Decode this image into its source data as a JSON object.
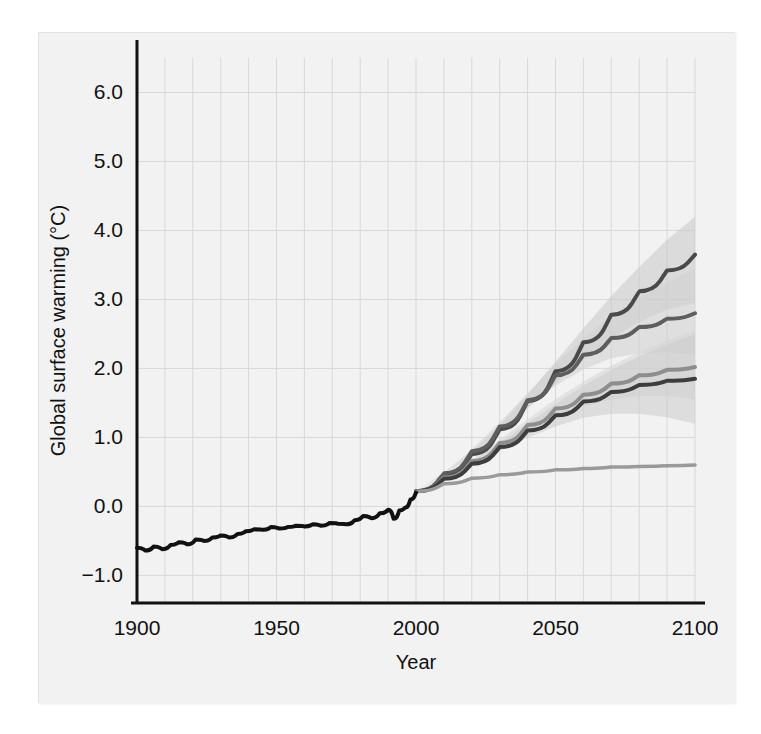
{
  "figure": {
    "background_color": "#f2f2f2",
    "page_background_color": "#ffffff",
    "border_color": "#e2e2e2"
  },
  "chart_data": {
    "type": "line",
    "title": "",
    "subtitle": "",
    "xlabel": "Year",
    "ylabel": "Global surface warming (°C)",
    "xlim": [
      1900,
      2100
    ],
    "ylim": [
      -1.4,
      6.5
    ],
    "xticks": [
      1900,
      1950,
      2000,
      2050,
      2100
    ],
    "xticklabels": [
      "1900",
      "1950",
      "2000",
      "2050",
      "2100"
    ],
    "yticks": [
      -1.0,
      0.0,
      1.0,
      2.0,
      3.0,
      4.0,
      5.0,
      6.0
    ],
    "yticklabels": [
      "-1.0",
      "0.0",
      "1.0",
      "2.0",
      "3.0",
      "4.0",
      "5.0",
      "6.0"
    ],
    "grid": true,
    "grid_x_step": 10,
    "grid_y_step": 1.0,
    "grid_color": "#d8d8d8",
    "legend": "none",
    "legend_position": "none",
    "annotations": [],
    "series": [
      {
        "name": "20th century observations",
        "kind": "historical",
        "color": "#111111",
        "line_width": 4.0,
        "x": [
          1900,
          1903,
          1906,
          1909,
          1912,
          1915,
          1918,
          1921,
          1924,
          1927,
          1930,
          1933,
          1936,
          1939,
          1942,
          1945,
          1948,
          1951,
          1954,
          1957,
          1960,
          1963,
          1966,
          1969,
          1972,
          1975,
          1978,
          1981,
          1984,
          1987,
          1990,
          1992,
          1994,
          1996,
          1998,
          2000
        ],
        "values": [
          -0.6,
          -0.64,
          -0.58,
          -0.62,
          -0.56,
          -0.52,
          -0.55,
          -0.48,
          -0.5,
          -0.45,
          -0.42,
          -0.45,
          -0.4,
          -0.36,
          -0.33,
          -0.34,
          -0.3,
          -0.32,
          -0.3,
          -0.28,
          -0.29,
          -0.26,
          -0.28,
          -0.24,
          -0.25,
          -0.26,
          -0.2,
          -0.14,
          -0.17,
          -0.1,
          -0.05,
          -0.18,
          -0.06,
          -0.02,
          0.1,
          0.2
        ]
      },
      {
        "name": "A2",
        "kind": "projection",
        "color": "#4a4a4a",
        "line_width": 4.0,
        "x": [
          2000,
          2010,
          2020,
          2030,
          2040,
          2050,
          2060,
          2070,
          2080,
          2090,
          2100
        ],
        "values": [
          0.22,
          0.46,
          0.76,
          1.12,
          1.53,
          1.96,
          2.38,
          2.78,
          3.12,
          3.42,
          3.65
        ],
        "band_low_2100": 2.95,
        "band_high_2100": 4.2,
        "band_color": "#c9c9c9"
      },
      {
        "name": "A1B",
        "kind": "projection",
        "color": "#5e5e5e",
        "line_width": 4.0,
        "x": [
          2000,
          2010,
          2020,
          2030,
          2040,
          2050,
          2060,
          2070,
          2080,
          2090,
          2100
        ],
        "values": [
          0.22,
          0.48,
          0.8,
          1.16,
          1.54,
          1.9,
          2.2,
          2.44,
          2.6,
          2.72,
          2.8
        ],
        "band_low_2100": 2.2,
        "band_high_2100": 3.45,
        "band_color": "#cfcfcf"
      },
      {
        "name": "B1",
        "kind": "projection",
        "color": "#8e8e8e",
        "line_width": 4.0,
        "x": [
          2000,
          2010,
          2020,
          2030,
          2040,
          2050,
          2060,
          2070,
          2080,
          2090,
          2100
        ],
        "values": [
          0.22,
          0.42,
          0.66,
          0.92,
          1.18,
          1.42,
          1.62,
          1.78,
          1.9,
          1.98,
          2.02
        ],
        "band_low_2100": 1.55,
        "band_high_2100": 2.55,
        "band_color": "#d6d6d6"
      },
      {
        "name": "B2 / lower emissions",
        "kind": "projection",
        "color": "#3d3d3d",
        "line_width": 4.0,
        "x": [
          2000,
          2010,
          2020,
          2030,
          2040,
          2050,
          2060,
          2070,
          2080,
          2090,
          2100
        ],
        "values": [
          0.22,
          0.4,
          0.62,
          0.86,
          1.1,
          1.32,
          1.52,
          1.66,
          1.76,
          1.82,
          1.85
        ],
        "band_low_2100": 1.2,
        "band_high_2100": 2.5,
        "band_color": "#cccccc"
      },
      {
        "name": "Year 2000 constant concentrations",
        "kind": "commitment",
        "color": "#9a9a9a",
        "line_width": 3.5,
        "x": [
          2000,
          2010,
          2020,
          2030,
          2040,
          2050,
          2060,
          2070,
          2080,
          2090,
          2100
        ],
        "values": [
          0.22,
          0.33,
          0.41,
          0.46,
          0.5,
          0.53,
          0.55,
          0.57,
          0.58,
          0.59,
          0.6
        ],
        "band_low_2100": 0.6,
        "band_high_2100": 0.6,
        "band_color": "none"
      }
    ]
  }
}
